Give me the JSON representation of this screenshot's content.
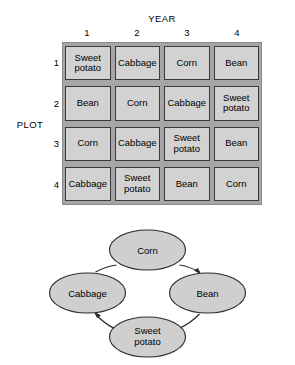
{
  "figure": {
    "axes": {
      "column_axis_title": "YEAR",
      "row_axis_title": "PLOT",
      "column_labels": [
        "1",
        "2",
        "3",
        "4"
      ],
      "row_labels": [
        "1",
        "2",
        "3",
        "4"
      ]
    },
    "grid": {
      "rows": [
        [
          "Sweet potato",
          "Cabbage",
          "Corn",
          "Bean"
        ],
        [
          "Bean",
          "Corn",
          "Cabbage",
          "Sweet potato"
        ],
        [
          "Corn",
          "Cabbage",
          "Sweet potato",
          "Bean"
        ],
        [
          "Cabbage",
          "Sweet potato",
          "Bean",
          "Corn"
        ]
      ]
    }
  },
  "cycle": {
    "nodes": [
      {
        "id": "corn",
        "label": "Corn",
        "label_lines": [
          "Corn"
        ],
        "cx": 120,
        "cy": 35,
        "rx": 38,
        "ry": 20
      },
      {
        "id": "bean",
        "label": "Bean",
        "label_lines": [
          "Bean"
        ],
        "cx": 180,
        "cy": 78,
        "rx": 38,
        "ry": 20
      },
      {
        "id": "sweet-potato",
        "label": "Sweet potato",
        "label_lines": [
          "Sweet",
          "potato"
        ],
        "cx": 120,
        "cy": 122,
        "rx": 38,
        "ry": 20
      },
      {
        "id": "cabbage",
        "label": "Cabbage",
        "label_lines": [
          "Cabbage"
        ],
        "cx": 60,
        "cy": 78,
        "rx": 38,
        "ry": 20
      }
    ],
    "edges": [
      {
        "from": "corn",
        "to": "bean"
      },
      {
        "from": "bean",
        "to": "sweet-potato"
      },
      {
        "from": "sweet-potato",
        "to": "cabbage"
      },
      {
        "from": "cabbage",
        "to": "corn"
      }
    ]
  },
  "colors": {
    "cell_fill": "#d2d2d2",
    "grid_background": "#a6a6a6",
    "cell_border": "#3a3a3a",
    "node_fill": "#cfcfcf",
    "node_stroke": "#2b2b2b",
    "page_background": "#ffffff"
  }
}
